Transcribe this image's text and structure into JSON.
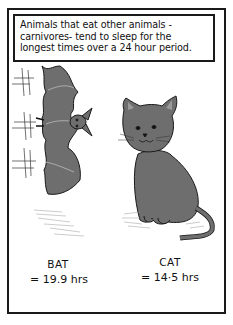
{
  "caption": {
    "text": "Animals that eat other animals -carnivores- tend to sleep for the longest times over a 24 hour period."
  },
  "animals": [
    {
      "name": "BAT",
      "value": "= 19.9 hrs",
      "illustration": "bat-hanging-upside-down"
    },
    {
      "name": "CAT",
      "value": "= 14·5 hrs",
      "illustration": "cat-sitting"
    }
  ],
  "colors": {
    "ink": "#1a1a1a",
    "fill_gray": "#6e6e6e",
    "light_gray": "#9a9a9a",
    "background": "#ffffff"
  }
}
